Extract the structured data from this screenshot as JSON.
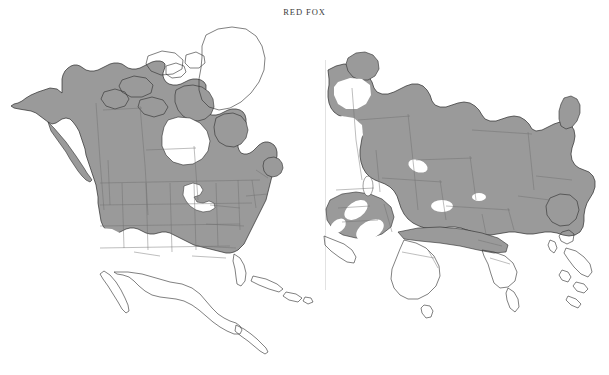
{
  "title": "RED FOX",
  "document": {
    "kind": "species-distribution-map",
    "species_common_name": "RED FOX",
    "panel_count": 2
  },
  "style": {
    "range_fill": "#9a9a9a",
    "range_fill_light": "#a5a5a5",
    "outline": "#2b2b2b",
    "internal_border": "#6d6d6d",
    "background": "#ffffff",
    "title_color": "#3a3a3a",
    "divider": "#e2e2e2"
  },
  "panels": [
    {
      "name": "north-america",
      "label": "North America",
      "regions_shaded": [
        "Alaska",
        "Canada (mainland)",
        "Newfoundland",
        "Labrador",
        "Contiguous United States (most)",
        "Great Plains",
        "Eastern United States"
      ],
      "regions_unshaded": [
        "Greenland",
        "Canadian Arctic Archipelago",
        "Hudson Bay",
        "Great Lakes",
        "Southwestern United States deserts",
        "Great Basin",
        "Mexico",
        "Central America",
        "Caribbean Islands",
        "Baja California",
        "Florida peninsula (southern tip)"
      ]
    },
    {
      "name": "eurasia",
      "label": "Eurasia",
      "regions_shaded": [
        "Scandinavia",
        "Europe",
        "European Russia",
        "Siberia",
        "Kamchatka",
        "Central Asia",
        "Mongolia",
        "Northern China",
        "Anatolia",
        "Iran",
        "Northern India (Himalaya)",
        "Korea"
      ],
      "regions_unshaded": [
        "Arabian Desert",
        "Syrian Desert",
        "Rub al Khali",
        "Taklamakan Desert",
        "Indian subcontinent (peninsular)",
        "Southeast Asia",
        "Sri Lanka",
        "Japan (outlined)",
        "Arctic Ocean"
      ]
    }
  ],
  "map_data": {
    "type": "choropleth-range",
    "shading_meaning": "Shaded gray indicates species range",
    "projection_hint": "two-panel hemispheric"
  }
}
